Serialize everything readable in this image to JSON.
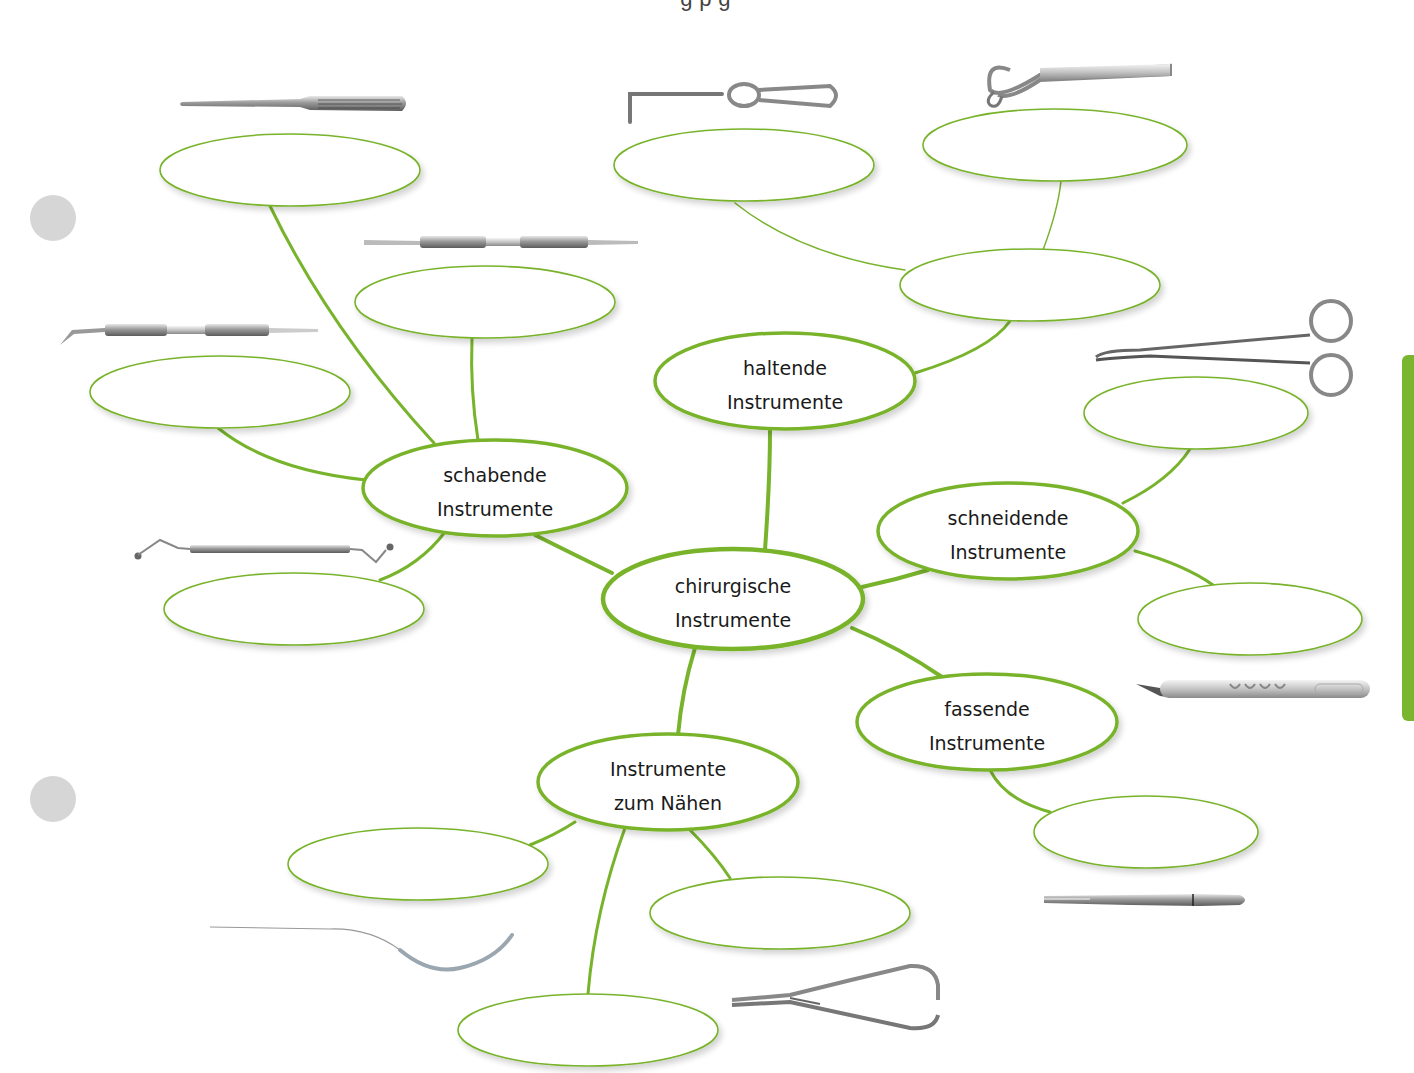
{
  "page": {
    "caption_partial": "g                          p                  g                   ",
    "accent_color": "#7ab52f",
    "line_color": "#78b32c",
    "marker_color": "#d6d6d6"
  },
  "mindmap": {
    "center": {
      "id": "center",
      "line1": "chirurgische",
      "line2": "Instrumente",
      "cx": 733,
      "cy": 599,
      "rx": 130,
      "ry": 50
    },
    "categories": [
      {
        "id": "haltende",
        "line1": "haltende",
        "line2": "Instrumente",
        "cx": 785,
        "cy": 381,
        "rx": 130,
        "ry": 48
      },
      {
        "id": "schabende",
        "line1": "schabende",
        "line2": "Instrumente",
        "cx": 495,
        "cy": 488,
        "rx": 132,
        "ry": 48
      },
      {
        "id": "schneidende",
        "line1": "schneidende",
        "line2": "Instrumente",
        "cx": 1008,
        "cy": 531,
        "rx": 130,
        "ry": 48
      },
      {
        "id": "fassende",
        "line1": "fassende",
        "line2": "Instrumente",
        "cx": 987,
        "cy": 722,
        "rx": 130,
        "ry": 48
      },
      {
        "id": "naehen",
        "line1": "Instrumente",
        "line2": "zum Nähen",
        "cx": 668,
        "cy": 782,
        "rx": 130,
        "ry": 48
      }
    ],
    "blank_fields": [
      {
        "id": "blank-schabende-1",
        "parent": "schabende",
        "cx": 290,
        "cy": 170,
        "rx": 130,
        "ry": 36,
        "value": ""
      },
      {
        "id": "blank-schabende-2",
        "parent": "schabende",
        "cx": 485,
        "cy": 302,
        "rx": 130,
        "ry": 36,
        "value": ""
      },
      {
        "id": "blank-schabende-3",
        "parent": "schabende",
        "cx": 220,
        "cy": 392,
        "rx": 130,
        "ry": 36,
        "value": ""
      },
      {
        "id": "blank-schabende-4",
        "parent": "schabende",
        "cx": 294,
        "cy": 609,
        "rx": 130,
        "ry": 36,
        "value": ""
      },
      {
        "id": "blank-haltende-hub",
        "parent": "haltende",
        "cx": 1030,
        "cy": 285,
        "rx": 130,
        "ry": 36,
        "value": ""
      },
      {
        "id": "blank-haltende-1",
        "parent": "blank-haltende-hub",
        "cx": 744,
        "cy": 165,
        "rx": 130,
        "ry": 36,
        "value": ""
      },
      {
        "id": "blank-haltende-2",
        "parent": "blank-haltende-hub",
        "cx": 1055,
        "cy": 145,
        "rx": 132,
        "ry": 36,
        "value": ""
      },
      {
        "id": "blank-schneidende-1",
        "parent": "schneidende",
        "cx": 1196,
        "cy": 413,
        "rx": 112,
        "ry": 36,
        "value": ""
      },
      {
        "id": "blank-schneidende-2",
        "parent": "schneidende",
        "cx": 1250,
        "cy": 619,
        "rx": 112,
        "ry": 36,
        "value": ""
      },
      {
        "id": "blank-fassende-1",
        "parent": "fassende",
        "cx": 1146,
        "cy": 832,
        "rx": 112,
        "ry": 36,
        "value": ""
      },
      {
        "id": "blank-naehen-1",
        "parent": "naehen",
        "cx": 418,
        "cy": 864,
        "rx": 130,
        "ry": 36,
        "value": ""
      },
      {
        "id": "blank-naehen-2",
        "parent": "naehen",
        "cx": 780,
        "cy": 913,
        "rx": 130,
        "ry": 36,
        "value": ""
      },
      {
        "id": "blank-naehen-3",
        "parent": "naehen",
        "cx": 588,
        "cy": 1030,
        "rx": 130,
        "ry": 36,
        "value": ""
      }
    ],
    "instrument_images": [
      {
        "id": "raspatorium",
        "icon": "periosteal-elevator-icon",
        "x": 180,
        "y": 96
      },
      {
        "id": "double-ended-scaler-1",
        "icon": "double-ended-instrument-icon",
        "x": 362,
        "y": 234
      },
      {
        "id": "double-ended-probe",
        "icon": "double-ended-probe-icon",
        "x": 58,
        "y": 322
      },
      {
        "id": "bone-curette",
        "icon": "bone-curette-icon",
        "x": 132,
        "y": 541
      },
      {
        "id": "wound-hook",
        "icon": "wound-retractor-hook-icon",
        "x": 620,
        "y": 84
      },
      {
        "id": "tongue-retractor",
        "icon": "tongue-retractor-icon",
        "x": 984,
        "y": 56
      },
      {
        "id": "surgical-scissors",
        "icon": "surgical-scissors-icon",
        "x": 1094,
        "y": 304
      },
      {
        "id": "scalpel",
        "icon": "scalpel-icon",
        "x": 1132,
        "y": 678
      },
      {
        "id": "tweezers",
        "icon": "surgical-tweezers-icon",
        "x": 1042,
        "y": 893
      },
      {
        "id": "suture-needle",
        "icon": "suture-needle-icon",
        "x": 210,
        "y": 925
      },
      {
        "id": "needle-holder",
        "icon": "needle-holder-icon",
        "x": 730,
        "y": 960
      }
    ]
  }
}
